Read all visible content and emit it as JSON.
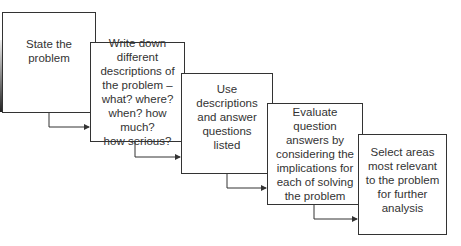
{
  "diagram": {
    "type": "staircase-flow",
    "steps": [
      {
        "label": "State the\nproblem"
      },
      {
        "label": "Write down\ndifferent\ndescriptions of\nthe problem –\nwhat? where?\nwhen? how much?\nhow serious?"
      },
      {
        "label": "Use\ndescriptions\nand answer\nquestions\nlisted"
      },
      {
        "label": "Evaluate\nquestion\nanswers by\nconsidering the\nimplications for\neach of solving\nthe problem"
      },
      {
        "label": "Select areas\nmost relevant\nto the problem\nfor further\nanalysis"
      }
    ]
  }
}
